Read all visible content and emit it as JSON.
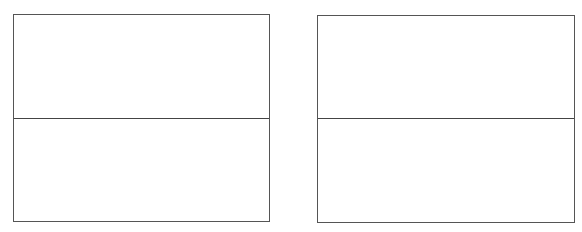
{
  "diagram": {
    "panels": [
      {
        "id": "left",
        "top_cell_text": "",
        "bottom_cell_text": ""
      },
      {
        "id": "right",
        "top_cell_text": "",
        "bottom_cell_text": ""
      }
    ],
    "colors": {
      "border": "#555555",
      "divider": "#444444",
      "background": "#ffffff"
    }
  }
}
